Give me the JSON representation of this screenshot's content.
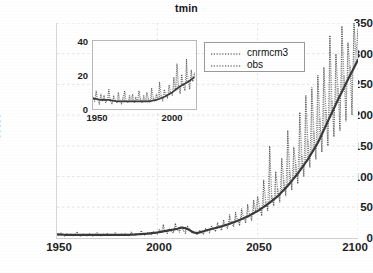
{
  "chart_data": {
    "type": "line",
    "title": "tmin",
    "xlabel": "",
    "ylabel": "HWI",
    "xlim": [
      1950,
      2100
    ],
    "ylim": [
      0,
      350
    ],
    "xticks": [
      1950,
      2000,
      2050,
      2100
    ],
    "yticks": [
      0,
      50,
      100,
      150,
      200,
      250,
      300,
      350
    ],
    "grid": true,
    "legend_position": "upper-center",
    "legend": [
      "cnrmcm3",
      "obs"
    ],
    "colors": {
      "cnrmcm3": "#2b2b2b",
      "obs": "#3a3a3a",
      "grid": "#e2e2e2",
      "axis": "#cfcfcf",
      "text": "#1d1d1d"
    },
    "series": [
      {
        "name": "cnrmcm3",
        "style": "dotted",
        "x": [
          1950,
          1951,
          1952,
          1953,
          1954,
          1955,
          1956,
          1957,
          1958,
          1959,
          1960,
          1961,
          1962,
          1963,
          1964,
          1965,
          1966,
          1967,
          1968,
          1969,
          1970,
          1971,
          1972,
          1973,
          1974,
          1975,
          1976,
          1977,
          1978,
          1979,
          1980,
          1981,
          1982,
          1983,
          1984,
          1985,
          1986,
          1987,
          1988,
          1989,
          1990,
          1991,
          1992,
          1993,
          1994,
          1995,
          1996,
          1997,
          1998,
          1999,
          2000,
          2001,
          2002,
          2003,
          2004,
          2005,
          2006,
          2007,
          2008,
          2009,
          2010,
          2011,
          2012,
          2013,
          2014,
          2015,
          2016,
          2017,
          2018,
          2019,
          2020,
          2021,
          2022,
          2023,
          2024,
          2025,
          2026,
          2027,
          2028,
          2029,
          2030,
          2031,
          2032,
          2033,
          2034,
          2035,
          2036,
          2037,
          2038,
          2039,
          2040,
          2041,
          2042,
          2043,
          2044,
          2045,
          2046,
          2047,
          2048,
          2049,
          2050,
          2051,
          2052,
          2053,
          2054,
          2055,
          2056,
          2057,
          2058,
          2059,
          2060,
          2061,
          2062,
          2063,
          2064,
          2065,
          2066,
          2067,
          2068,
          2069,
          2070,
          2071,
          2072,
          2073,
          2074,
          2075,
          2076,
          2077,
          2078,
          2079,
          2080,
          2081,
          2082,
          2083,
          2084,
          2085,
          2086,
          2087,
          2088,
          2089,
          2090,
          2091,
          2092,
          2093,
          2094,
          2095,
          2096,
          2097,
          2098,
          2099,
          2100
        ],
        "values": [
          6,
          3,
          9,
          5,
          2,
          8,
          4,
          7,
          3,
          6,
          10,
          4,
          2,
          7,
          5,
          3,
          8,
          5,
          2,
          6,
          9,
          4,
          3,
          7,
          5,
          8,
          3,
          6,
          4,
          9,
          5,
          3,
          7,
          4,
          8,
          5,
          3,
          10,
          6,
          4,
          7,
          5,
          12,
          6,
          4,
          9,
          7,
          5,
          11,
          8,
          6,
          14,
          9,
          22,
          11,
          7,
          16,
          10,
          8,
          24,
          13,
          9,
          18,
          12,
          7,
          20,
          14,
          9,
          11,
          7,
          5,
          13,
          9,
          6,
          16,
          11,
          8,
          20,
          14,
          10,
          25,
          17,
          12,
          30,
          20,
          15,
          38,
          24,
          18,
          42,
          28,
          20,
          48,
          33,
          24,
          55,
          38,
          28,
          62,
          44,
          68,
          50,
          36,
          95,
          60,
          44,
          150,
          70,
          52,
          108,
          80,
          58,
          130,
          95,
          68,
          175,
          110,
          78,
          148,
          120,
          88,
          205,
          135,
          100,
          232,
          160,
          115,
          245,
          175,
          128,
          265,
          195,
          140,
          278,
          210,
          150,
          330,
          225,
          165,
          300,
          245,
          175,
          345,
          265,
          190,
          318,
          280,
          200,
          352,
          300,
          340
        ],
        "marker": "dotted-vertical-scatter"
      },
      {
        "name": "obs",
        "style": "solid-smooth",
        "x": [
          1950,
          1955,
          1960,
          1965,
          1970,
          1975,
          1980,
          1985,
          1990,
          1995,
          2000,
          2005,
          2010,
          2012,
          2014,
          2016,
          2018,
          2020,
          2022,
          2025,
          2030,
          2035,
          2040,
          2045,
          2050,
          2055,
          2060,
          2065,
          2070,
          2075,
          2080,
          2085,
          2090,
          2095,
          2100
        ],
        "values": [
          6,
          5,
          5,
          5,
          5,
          5,
          5,
          5,
          6,
          7,
          9,
          12,
          15,
          17,
          16,
          13,
          9,
          8,
          10,
          13,
          17,
          22,
          28,
          35,
          44,
          55,
          68,
          85,
          105,
          128,
          155,
          190,
          225,
          258,
          290
        ]
      }
    ],
    "inset": {
      "type": "line",
      "xlim": [
        1950,
        2015
      ],
      "ylim": [
        0,
        45
      ],
      "xticks": [
        1950,
        2000
      ],
      "yticks": [
        0,
        20,
        40
      ],
      "series": [
        {
          "name": "cnrmcm3",
          "style": "dotted",
          "x": [
            1950,
            1951,
            1952,
            1953,
            1954,
            1955,
            1956,
            1957,
            1958,
            1959,
            1960,
            1961,
            1962,
            1963,
            1964,
            1965,
            1966,
            1967,
            1968,
            1969,
            1970,
            1971,
            1972,
            1973,
            1974,
            1975,
            1976,
            1977,
            1978,
            1979,
            1980,
            1981,
            1982,
            1983,
            1984,
            1985,
            1986,
            1987,
            1988,
            1989,
            1990,
            1991,
            1992,
            1993,
            1994,
            1995,
            1996,
            1997,
            1998,
            1999,
            2000,
            2001,
            2002,
            2003,
            2004,
            2005,
            2006,
            2007,
            2008,
            2009,
            2010,
            2011,
            2012,
            2013,
            2014
          ],
          "values": [
            8,
            5,
            12,
            6,
            3,
            10,
            5,
            9,
            4,
            7,
            13,
            5,
            3,
            9,
            6,
            4,
            11,
            6,
            3,
            8,
            12,
            5,
            4,
            9,
            6,
            10,
            4,
            8,
            5,
            12,
            7,
            4,
            9,
            5,
            11,
            7,
            4,
            14,
            8,
            5,
            10,
            7,
            18,
            9,
            5,
            13,
            10,
            7,
            16,
            11,
            9,
            21,
            13,
            30,
            16,
            10,
            23,
            15,
            12,
            33,
            19,
            13,
            26,
            18,
            24
          ]
        },
        {
          "name": "obs",
          "style": "solid-smooth",
          "x": [
            1950,
            1955,
            1960,
            1965,
            1970,
            1975,
            1980,
            1985,
            1990,
            1995,
            2000,
            2005,
            2010,
            2014
          ],
          "values": [
            7,
            6,
            6,
            5,
            5,
            5,
            5,
            5,
            6,
            8,
            11,
            15,
            18,
            21
          ]
        }
      ]
    }
  },
  "axes": {
    "y_tick_labels": [
      "350",
      "300",
      "250",
      "200",
      "150",
      "100",
      "50",
      "0"
    ],
    "x_tick_labels": [
      "1950",
      "2000",
      "2050",
      "2100"
    ],
    "y_axis_label": "HWI"
  },
  "inset_axes": {
    "y_tick_labels": [
      "40",
      "20",
      "0"
    ],
    "x_tick_labels": [
      "1950",
      "2000"
    ]
  },
  "legend": {
    "entries": [
      {
        "label": "cnrmcm3"
      },
      {
        "label": "obs"
      }
    ]
  }
}
